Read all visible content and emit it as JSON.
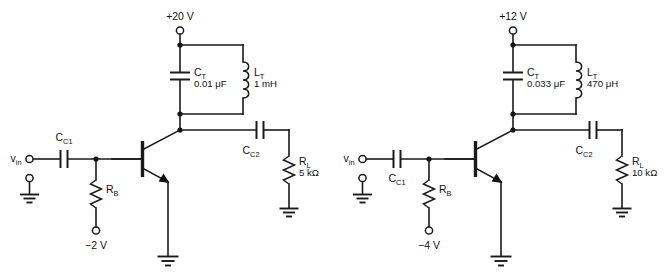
{
  "figure": {
    "background_color": "#ffffff",
    "line_color": "#1a1a1a"
  },
  "circuits": [
    {
      "id": "circuit-a",
      "supply_label": "+20 V",
      "input_label": "v",
      "input_label_sub": "in",
      "coupling_cap_in": {
        "name": "C",
        "sub": "C1"
      },
      "coupling_cap_in_position": "above",
      "bias_resistor": {
        "name": "R",
        "sub": "B"
      },
      "bias_supply_label": "−2 V",
      "tank_capacitor": {
        "name": "C",
        "sub": "T",
        "value": "0.01 μF"
      },
      "tank_inductor": {
        "name": "L",
        "sub": "T",
        "value": "1 mH"
      },
      "coupling_cap_out": {
        "name": "C",
        "sub": "C2"
      },
      "load_resistor": {
        "name": "R",
        "sub": "L",
        "value": "5 kΩ"
      },
      "transistor_type": "npn"
    },
    {
      "id": "circuit-b",
      "supply_label": "+12 V",
      "input_label": "v",
      "input_label_sub": "in",
      "coupling_cap_in": {
        "name": "C",
        "sub": "C1"
      },
      "coupling_cap_in_position": "below",
      "bias_resistor": {
        "name": "R",
        "sub": "B"
      },
      "bias_supply_label": "−4 V",
      "tank_capacitor": {
        "name": "C",
        "sub": "T",
        "value": "0.033 μF"
      },
      "tank_inductor": {
        "name": "L",
        "sub": "T",
        "value": "470 μH"
      },
      "coupling_cap_out": {
        "name": "C",
        "sub": "C2"
      },
      "load_resistor": {
        "name": "R",
        "sub": "L",
        "value": "10 kΩ"
      },
      "transistor_type": "npn"
    }
  ]
}
